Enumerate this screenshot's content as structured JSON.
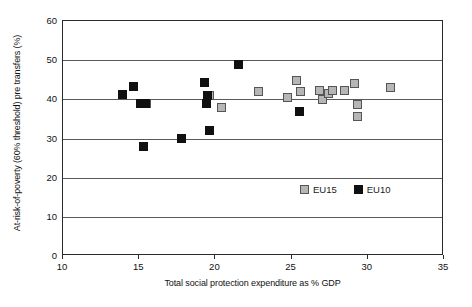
{
  "chart_data": {
    "type": "scatter",
    "title": "",
    "xlabel": "Total social protection expenditure as % GDP",
    "ylabel": "At-risk-of-poverty (60% threshold) pre transfers (%)",
    "xlim": [
      10,
      35
    ],
    "ylim": [
      0,
      60
    ],
    "xticks": [
      10,
      15,
      20,
      25,
      30,
      35
    ],
    "yticks": [
      0,
      10,
      20,
      30,
      40,
      50,
      60
    ],
    "grid": "horizontal",
    "legend_position": "inside-lower-right",
    "series": [
      {
        "name": "EU15",
        "color": "#b6b6b6",
        "marker": "square",
        "points": [
          [
            15.5,
            39.0
          ],
          [
            19.6,
            41.0
          ],
          [
            20.4,
            38.0
          ],
          [
            22.8,
            42.0
          ],
          [
            24.7,
            40.5
          ],
          [
            25.3,
            44.8
          ],
          [
            25.6,
            42.0
          ],
          [
            26.8,
            42.3
          ],
          [
            27.0,
            40.0
          ],
          [
            27.4,
            41.6
          ],
          [
            27.7,
            42.2
          ],
          [
            28.5,
            42.2
          ],
          [
            29.1,
            44.0
          ],
          [
            29.3,
            38.6
          ],
          [
            29.3,
            35.6
          ],
          [
            31.5,
            43.0
          ]
        ]
      },
      {
        "name": "EU10",
        "color": "#101010",
        "marker": "square",
        "points": [
          [
            13.9,
            41.2
          ],
          [
            14.6,
            43.2
          ],
          [
            15.1,
            39.0
          ],
          [
            15.4,
            39.0
          ],
          [
            15.3,
            28.0
          ],
          [
            17.8,
            30.0
          ],
          [
            19.3,
            44.3
          ],
          [
            19.5,
            41.0
          ],
          [
            19.4,
            39.0
          ],
          [
            19.6,
            32.0
          ],
          [
            21.5,
            48.8
          ],
          [
            25.5,
            37.0
          ]
        ]
      }
    ]
  },
  "legend": {
    "entries": [
      {
        "label": "EU15",
        "key": "eu15"
      },
      {
        "label": "EU10",
        "key": "eu10"
      }
    ]
  }
}
